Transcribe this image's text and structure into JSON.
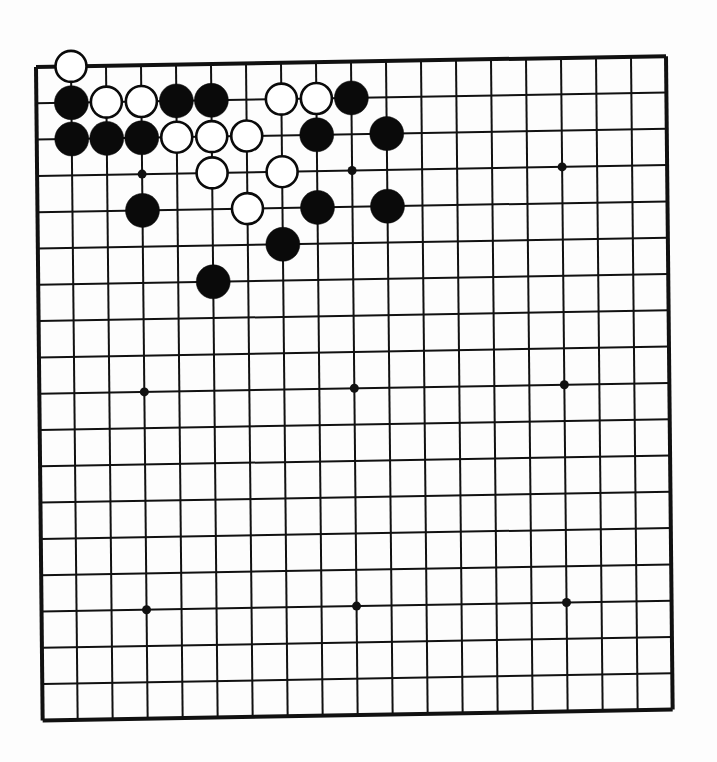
{
  "board": {
    "size": 19,
    "origin": {
      "x": 36,
      "y": 67
    },
    "skew": {
      "dx_per_row": 0.37,
      "dy_per_col": -0.6
    },
    "spacing_x": 35.0,
    "spacing_y": 36.3,
    "line_color": "#111111",
    "background": "#fdfdfd",
    "star_points": [
      [
        3,
        3
      ],
      [
        9,
        3
      ],
      [
        15,
        3
      ],
      [
        3,
        9
      ],
      [
        9,
        9
      ],
      [
        15,
        9
      ],
      [
        3,
        15
      ],
      [
        9,
        15
      ],
      [
        15,
        15
      ]
    ]
  },
  "stones": [
    {
      "color": "white",
      "col": 1,
      "row": 0
    },
    {
      "color": "black",
      "col": 1,
      "row": 1
    },
    {
      "color": "white",
      "col": 2,
      "row": 1
    },
    {
      "color": "white",
      "col": 3,
      "row": 1
    },
    {
      "color": "black",
      "col": 4,
      "row": 1
    },
    {
      "color": "black",
      "col": 5,
      "row": 1
    },
    {
      "color": "white",
      "col": 7,
      "row": 1
    },
    {
      "color": "white",
      "col": 8,
      "row": 1
    },
    {
      "color": "black",
      "col": 9,
      "row": 1
    },
    {
      "color": "black",
      "col": 1,
      "row": 2
    },
    {
      "color": "black",
      "col": 2,
      "row": 2
    },
    {
      "color": "black",
      "col": 3,
      "row": 2
    },
    {
      "color": "white",
      "col": 4,
      "row": 2
    },
    {
      "color": "white",
      "col": 5,
      "row": 2
    },
    {
      "color": "white",
      "col": 6,
      "row": 2
    },
    {
      "color": "black",
      "col": 8,
      "row": 2
    },
    {
      "color": "black",
      "col": 10,
      "row": 2
    },
    {
      "color": "white",
      "col": 5,
      "row": 3
    },
    {
      "color": "white",
      "col": 7,
      "row": 3
    },
    {
      "color": "black",
      "col": 3,
      "row": 4
    },
    {
      "color": "white",
      "col": 6,
      "row": 4
    },
    {
      "color": "black",
      "col": 8,
      "row": 4
    },
    {
      "color": "black",
      "col": 10,
      "row": 4
    },
    {
      "color": "black",
      "col": 7,
      "row": 5
    },
    {
      "color": "black",
      "col": 5,
      "row": 6
    }
  ]
}
